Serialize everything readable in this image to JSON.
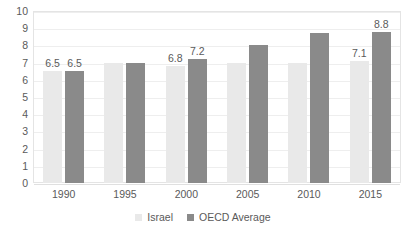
{
  "chart_data": {
    "type": "bar",
    "title": "",
    "subtitle": "",
    "xlabel": "",
    "ylabel": "",
    "categories": [
      "1990",
      "1995",
      "2000",
      "2005",
      "2010",
      "2015"
    ],
    "series": [
      {
        "name": "Israel",
        "color": "#e9e9e9",
        "values": [
          6.5,
          7.0,
          6.8,
          7.0,
          7.0,
          7.1
        ],
        "labels": [
          "6.5",
          "",
          "6.8",
          "",
          "",
          "7.1"
        ]
      },
      {
        "name": "OECD Average",
        "color": "#8a8a8a",
        "values": [
          6.5,
          7.0,
          7.2,
          8.0,
          8.7,
          8.8
        ],
        "labels": [
          "6.5",
          "",
          "7.2",
          "",
          "",
          "8.8"
        ]
      }
    ],
    "ylim": [
      0,
      10
    ],
    "yticks": [
      "10",
      "9",
      "8",
      "7",
      "6",
      "5",
      "4",
      "3",
      "2",
      "1",
      "0"
    ],
    "grid": true,
    "legend_position": "bottom"
  },
  "legend": {
    "items": [
      {
        "label": "Israel"
      },
      {
        "label": "OECD Average"
      }
    ]
  }
}
